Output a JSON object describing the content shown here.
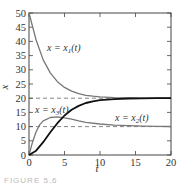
{
  "chart_data": {
    "type": "line",
    "title": "",
    "xlabel": "t",
    "ylabel": "x",
    "xlim": [
      0,
      20
    ],
    "ylim": [
      0,
      50
    ],
    "xticks": [
      0,
      5,
      10,
      15,
      20
    ],
    "yticks": [
      0,
      5,
      10,
      15,
      20,
      25,
      30,
      35,
      40,
      45,
      50
    ],
    "grid": false,
    "reference_lines": [
      {
        "y": 20,
        "style": "dashed"
      },
      {
        "y": 10,
        "style": "dashed"
      }
    ],
    "series": [
      {
        "name": "x = x1(t)",
        "color": "#777777",
        "x": [
          0,
          1,
          2,
          3,
          4,
          5,
          6,
          7,
          8,
          9,
          10,
          12,
          14,
          16,
          18,
          20
        ],
        "y": [
          50,
          40.5,
          33.5,
          28.9,
          25.8,
          23.8,
          22.5,
          21.6,
          21.0,
          20.7,
          20.5,
          20.2,
          20.1,
          20.05,
          20.02,
          20.0
        ]
      },
      {
        "name": "x = x2(t)",
        "color": "#777777",
        "x": [
          0,
          0.5,
          1,
          1.5,
          2,
          3,
          4,
          5,
          6,
          7,
          8,
          10,
          12,
          14,
          16,
          18,
          20
        ],
        "y": [
          0,
          4.5,
          8.2,
          10.6,
          12.0,
          13.2,
          13.4,
          13.1,
          12.6,
          12.0,
          11.5,
          10.9,
          10.5,
          10.3,
          10.15,
          10.08,
          10.04
        ]
      },
      {
        "name": "x = x3(t)",
        "color": "#111111",
        "x": [
          0,
          1,
          2,
          3,
          4,
          5,
          6,
          7,
          8,
          9,
          10,
          12,
          14,
          16,
          18,
          20
        ],
        "y": [
          0,
          1.5,
          4.5,
          8.0,
          11.2,
          13.9,
          15.9,
          17.3,
          18.3,
          18.9,
          19.3,
          19.7,
          19.9,
          19.95,
          20.0,
          20.0
        ]
      }
    ],
    "annotations": [
      {
        "text": "x = x1(t)",
        "near_series": "x = x1(t)"
      },
      {
        "text": "x = x3(t)",
        "near_series": "x = x3(t)"
      },
      {
        "text": "x = x2(t)",
        "near_series": "x = x2(t)"
      }
    ]
  },
  "labels": {
    "x1": "x = x",
    "x1_sub": "1",
    "x1_arg": "(t)",
    "x2": "x = x",
    "x2_sub": "2",
    "x2_arg": "(t)",
    "x3": "x = x",
    "x3_sub": "3",
    "x3_arg": "(t)",
    "xaxis": "t",
    "yaxis": "x"
  },
  "caption": "FIGURE 5.6"
}
